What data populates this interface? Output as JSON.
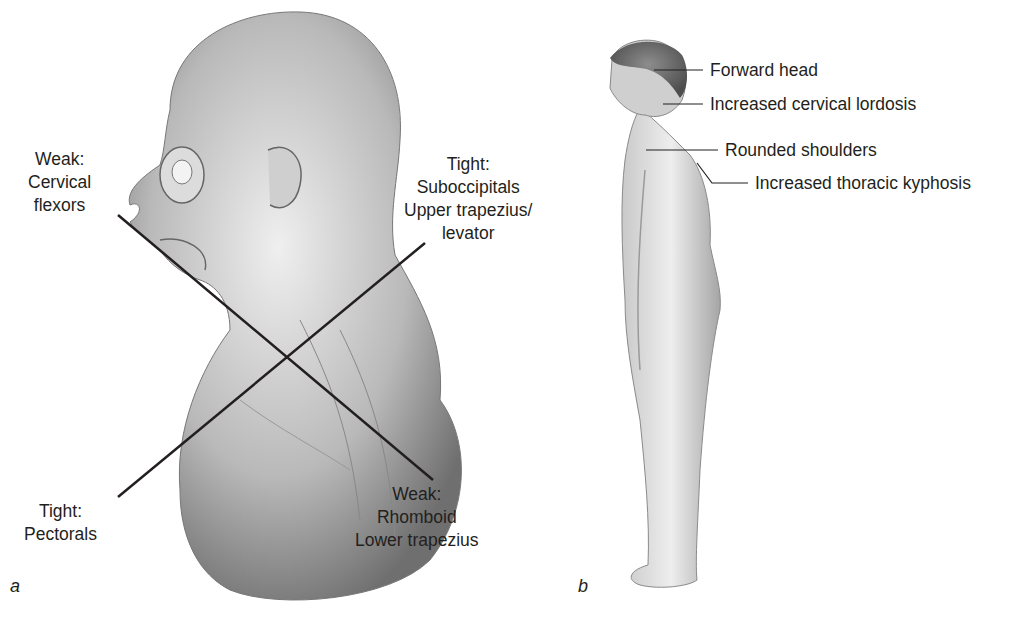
{
  "figure": {
    "panel_a": {
      "letter": "a",
      "labels": {
        "weak_cervical": {
          "line1": "Weak:",
          "line2": "Cervical",
          "line3": "flexors"
        },
        "tight_suboccipitals": {
          "line1": "Tight:",
          "line2": "Suboccipitals",
          "line3": "Upper trapezius/",
          "line4": "levator"
        },
        "tight_pectorals": {
          "line1": "Tight:",
          "line2": "Pectorals"
        },
        "weak_rhomboid": {
          "line1": "Weak:",
          "line2": "Rhomboid",
          "line3": "Lower trapezius"
        }
      }
    },
    "panel_b": {
      "letter": "b",
      "labels": {
        "forward_head": "Forward head",
        "cervical_lordosis": "Increased cervical lordosis",
        "rounded_shoulders": "Rounded shoulders",
        "thoracic_kyphosis": "Increased thoracic kyphosis"
      }
    },
    "colors": {
      "line": "#231f20",
      "text": "#231f20",
      "skin_light": "#e6e6e6",
      "skin_dark": "#8a8a8a"
    }
  }
}
